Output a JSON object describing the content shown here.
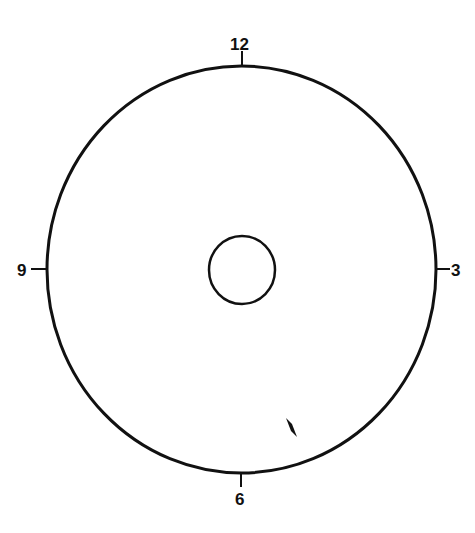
{
  "diagram": {
    "type": "clock-face-dial",
    "labels": {
      "top": "12",
      "right": "3",
      "bottom": "6",
      "left": "9"
    },
    "outer_circle": {
      "cx": 241.5,
      "cy": 269.5,
      "rx": 194.5,
      "ry": 203.5
    },
    "inner_circle": {
      "cx": 242,
      "cy": 270,
      "rx": 33,
      "ry": 34
    },
    "marker": {
      "shape": "parallelogram",
      "x": 291,
      "y": 427
    },
    "colors": {
      "stroke": "#111111",
      "background": "#ffffff"
    }
  }
}
